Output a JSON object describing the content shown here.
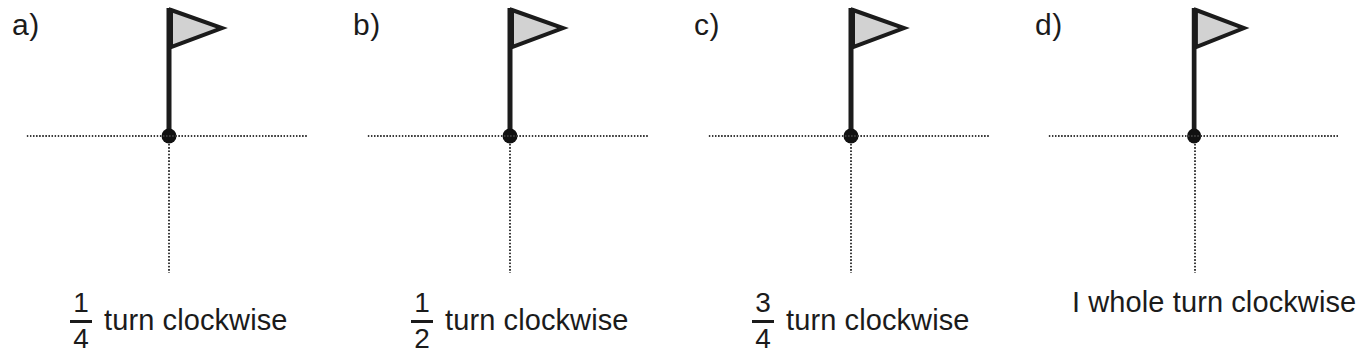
{
  "figure": {
    "type": "math-worksheet-figure",
    "topic": "fractional turns clockwise",
    "background_color": "#ffffff",
    "ink_color": "#1b1b1b",
    "flag_fill_color": "#d2d2d2",
    "flag_outline_color": "#1b1b1b",
    "pole_color": "#1b1b1b",
    "dot_color": "#111111",
    "axis_style": "dotted",
    "axis_color": "#3a3a3a"
  },
  "panels": [
    {
      "letter": "a)",
      "caption": {
        "kind": "fraction",
        "numerator": "1",
        "denominator": "4",
        "text": "turn clockwise",
        "full_text": "1/4 turn clockwise"
      },
      "flag": {
        "direction": "right",
        "pole_orientation": "vertical-up",
        "rotation_degrees": 0
      }
    },
    {
      "letter": "b)",
      "caption": {
        "kind": "fraction",
        "numerator": "1",
        "denominator": "2",
        "text": "turn clockwise",
        "full_text": "1/2 turn clockwise"
      },
      "flag": {
        "direction": "right",
        "pole_orientation": "vertical-up",
        "rotation_degrees": 0
      }
    },
    {
      "letter": "c)",
      "caption": {
        "kind": "fraction",
        "numerator": "3",
        "denominator": "4",
        "text": "turn clockwise",
        "full_text": "3/4 turn clockwise"
      },
      "flag": {
        "direction": "right",
        "pole_orientation": "vertical-up",
        "rotation_degrees": 0
      }
    },
    {
      "letter": "d)",
      "caption": {
        "kind": "plain",
        "numerator": "",
        "denominator": "",
        "text": "I whole turn clockwise",
        "full_text": "I whole turn clockwise"
      },
      "flag": {
        "direction": "right",
        "pole_orientation": "vertical-up",
        "rotation_degrees": 0
      }
    }
  ]
}
